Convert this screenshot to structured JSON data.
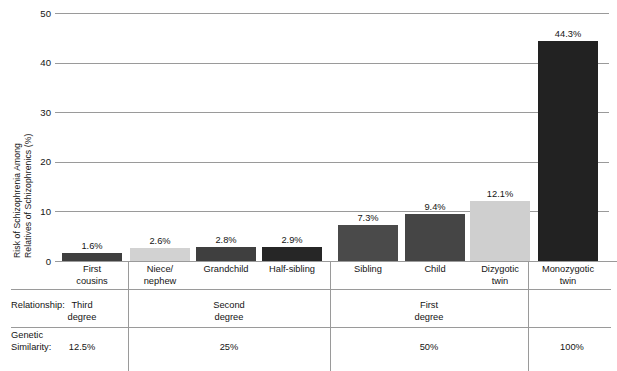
{
  "chart_data": {
    "type": "bar",
    "title": "",
    "xlabel": "",
    "ylabel_line1": "Risk of Schizophrenia Among",
    "ylabel_line2": "Relatives of Schizophrenics (%)",
    "ylim": [
      0,
      50
    ],
    "yticks": [
      "0",
      "10",
      "20",
      "30",
      "40",
      "50"
    ],
    "ytick_values": [
      0,
      10,
      20,
      30,
      40,
      50
    ],
    "grid": "horizontal",
    "legend": "none",
    "categories": [
      "First\ncousins",
      "Niece/\nnephew",
      "Grandchild",
      "Half-sibling",
      "Sibling",
      "Child",
      "Dizygotic\ntwin",
      "Monozygotic\ntwin"
    ],
    "values": [
      1.6,
      2.6,
      2.8,
      2.9,
      7.3,
      9.4,
      12.1,
      44.3
    ],
    "data_labels": [
      "1.6%",
      "2.6%",
      "2.8%",
      "2.9%",
      "7.3%",
      "9.4%",
      "12.1%",
      "44.3%"
    ],
    "bar_colors": [
      "#3f3f3f",
      "#d2d2d2",
      "#3f3f3f",
      "#262626",
      "#4a4a4a",
      "#454545",
      "#cfcfcf",
      "#222222"
    ],
    "grid_color": "#9a9a9a"
  },
  "annotation_table": {
    "row_labels": [
      "Relationship:",
      "Genetic\nSimilarity:"
    ],
    "groups": [
      {
        "relationship": "Third\ndegree",
        "genetic_similarity": "12.5%",
        "categories": [
          "First cousins"
        ]
      },
      {
        "relationship": "Second\ndegree",
        "genetic_similarity": "25%",
        "categories": [
          "Niece/nephew",
          "Grandchild",
          "Half-sibling"
        ]
      },
      {
        "relationship": "First\ndegree",
        "genetic_similarity": "50%",
        "categories": [
          "Sibling",
          "Child",
          "Dizygotic twin"
        ]
      },
      {
        "relationship": "",
        "genetic_similarity": "100%",
        "categories": [
          "Monozygotic twin"
        ]
      }
    ]
  }
}
